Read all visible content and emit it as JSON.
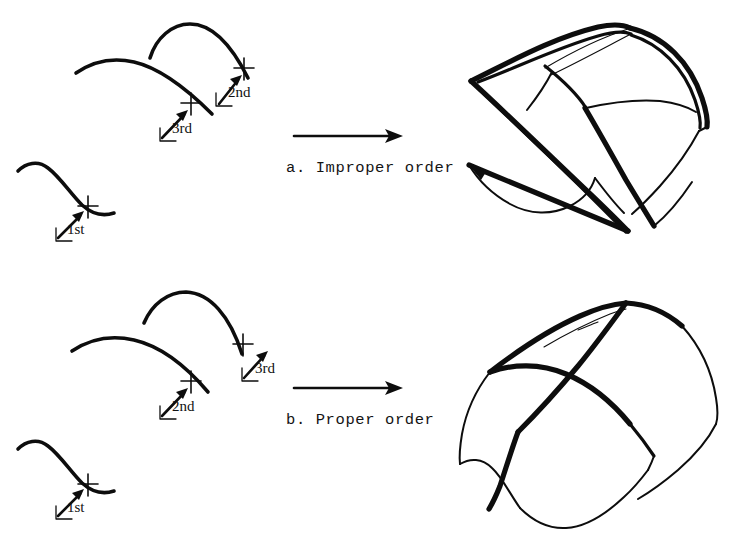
{
  "figure": {
    "background_color": "#ffffff",
    "ink_color": "#0d0d0d",
    "width": 730,
    "height": 546
  },
  "panels": [
    {
      "id": "a",
      "caption": "a. Improper order",
      "caption_position": {
        "x": 286,
        "y": 168
      },
      "curve_labels": [
        {
          "name": "1st",
          "text": "1st",
          "x": 67,
          "y": 229,
          "arrow_from": {
            "x": 54,
            "y": 240
          },
          "arrow_to": {
            "x": 82,
            "y": 215
          },
          "tick": {
            "x": 88,
            "y": 207
          }
        },
        {
          "name": "3rd",
          "text": "3rd",
          "x": 172,
          "y": 128,
          "arrow_from": {
            "x": 158,
            "y": 140
          },
          "arrow_to": {
            "x": 186,
            "y": 113
          },
          "tick": {
            "x": 191,
            "y": 104
          }
        },
        {
          "name": "2nd",
          "text": "2nd",
          "x": 228,
          "y": 92,
          "arrow_from": {
            "x": 214,
            "y": 105
          },
          "arrow_to": {
            "x": 239,
            "y": 77
          },
          "tick": {
            "x": 244,
            "y": 69
          }
        }
      ],
      "transform_arrow": {
        "from": {
          "x": 294,
          "y": 136
        },
        "to": {
          "x": 403,
          "y": 136
        }
      },
      "result_shape": "twisted-lofted-surface"
    },
    {
      "id": "b",
      "caption": "b. Proper order",
      "caption_position": {
        "x": 286,
        "y": 420
      },
      "curve_labels": [
        {
          "name": "1st",
          "text": "1st",
          "x": 67,
          "y": 507,
          "arrow_from": {
            "x": 54,
            "y": 518
          },
          "arrow_to": {
            "x": 82,
            "y": 493
          },
          "tick": {
            "x": 88,
            "y": 485
          }
        },
        {
          "name": "2nd",
          "text": "2nd",
          "x": 172,
          "y": 406,
          "arrow_from": {
            "x": 158,
            "y": 418
          },
          "arrow_to": {
            "x": 186,
            "y": 391
          },
          "tick": {
            "x": 191,
            "y": 382
          }
        },
        {
          "name": "3rd",
          "text": "3rd",
          "x": 255,
          "y": 368,
          "arrow_from": {
            "x": 240,
            "y": 380
          },
          "arrow_to": {
            "x": 266,
            "y": 353
          },
          "tick": {
            "x": 243,
            "y": 345
          }
        }
      ],
      "transform_arrow": {
        "from": {
          "x": 294,
          "y": 388
        },
        "to": {
          "x": 403,
          "y": 388
        }
      },
      "result_shape": "smooth-lofted-surface"
    }
  ],
  "legend_note": {
    "cross_marker_meaning": "curve start point marker",
    "arrow_meaning": "lofting operation"
  }
}
